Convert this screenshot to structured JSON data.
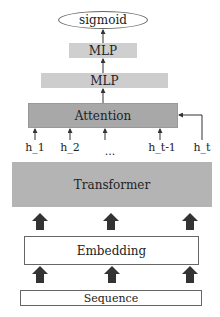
{
  "diagram": {
    "nodes": {
      "sigmoid": "sigmoid",
      "mlp_top": "MLP",
      "mlp_bottom": "MLP",
      "attention": "Attention",
      "transformer": "Transformer",
      "embedding": "Embedding",
      "sequence": "Sequence"
    },
    "hidden_states": [
      {
        "label": "h_1",
        "x": 35
      },
      {
        "label": "h_2",
        "x": 70
      },
      {
        "label": "...",
        "x": 110
      },
      {
        "label": "h_t-1",
        "x": 162
      },
      {
        "label": "h_t",
        "x": 202
      }
    ],
    "colors": {
      "attention_fill": "#a8a8a8",
      "transformer_fill": "#b4b4b4",
      "mlp_fill": "#cdcdcd",
      "arrow": "#333333"
    }
  }
}
